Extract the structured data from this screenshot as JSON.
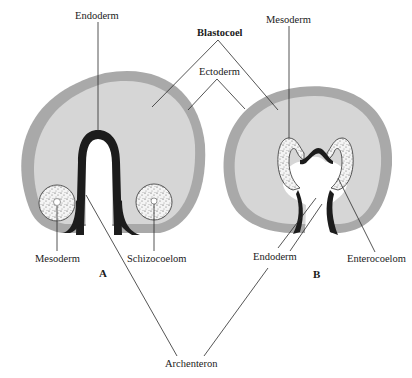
{
  "diagram": {
    "type": "embryology-cross-section-comparison",
    "panels": [
      {
        "id": "A",
        "label": "A",
        "description": "Schizocoelous mesoderm formation",
        "labels": {
          "endoderm": "Endoderm",
          "mesoderm": "Mesoderm",
          "schizocoelom": "Schizocoelom"
        }
      },
      {
        "id": "B",
        "label": "B",
        "description": "Enterocoelous mesoderm formation",
        "labels": {
          "mesoderm": "Mesoderm",
          "endoderm": "Endoderm",
          "enterocoelom": "Enterocoelom"
        }
      }
    ],
    "shared_labels": {
      "blastocoel": "Blastocoel",
      "ectoderm": "Ectoderm",
      "archenteron": "Archenteron"
    },
    "colors": {
      "ectoderm": "#a9a9a9",
      "blastocoel": "#d6d6d6",
      "endoderm": "#1c1c1c",
      "mesoderm_fill": "#f4f4f4",
      "background": "#ffffff",
      "leader_line": "#2a2a2a"
    }
  }
}
